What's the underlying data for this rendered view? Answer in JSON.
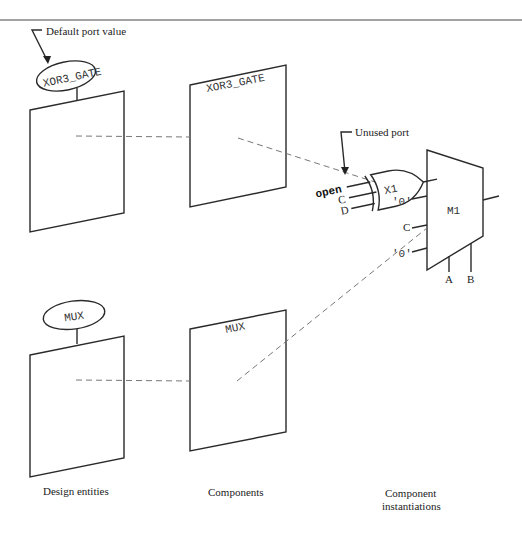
{
  "annotations": {
    "default_port_value": "Default port value",
    "unused_port": "Unused port"
  },
  "design_entities": {
    "label": "Design entities",
    "top_name": "XOR3_GATE",
    "bottom_name": "MUX"
  },
  "components": {
    "label": "Components",
    "top_name": "XOR3_GATE",
    "bottom_name": "MUX"
  },
  "instantiations": {
    "label_line1": "Component",
    "label_line2": "instantiations",
    "xor_instance": "X1",
    "mux_instance": "M1",
    "xor_inputs": [
      "open",
      "C",
      "D"
    ],
    "mux_inputs": [
      "'0'",
      "C",
      "'0'"
    ],
    "mux_selects": [
      "A",
      "B"
    ]
  }
}
